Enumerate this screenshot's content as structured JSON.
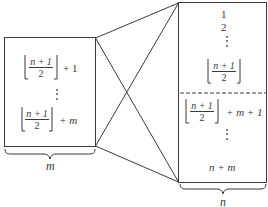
{
  "diagram": {
    "type": "bipartite-connection",
    "colors": {
      "stroke": "#3a3a3a",
      "background": "#ffffff",
      "dashed_divider": "#3a3a3a"
    },
    "left_box": {
      "brace_label": "m",
      "entries": [
        {
          "floor_num": "n + 1",
          "floor_den": "2",
          "suffix": "+ 1"
        },
        {
          "dots": "⋮"
        },
        {
          "floor_num": "n + 1",
          "floor_den": "2",
          "suffix": "+ m"
        }
      ]
    },
    "right_box": {
      "brace_label": "n",
      "upper": {
        "line1": "1",
        "line2": "2",
        "dots": "⋮",
        "floor_num": "n + 1",
        "floor_den": "2"
      },
      "lower": {
        "floor_num": "n + 1",
        "floor_den": "2",
        "suffix": "+ m + 1",
        "dots": "⋮",
        "last": "n + m"
      }
    }
  }
}
